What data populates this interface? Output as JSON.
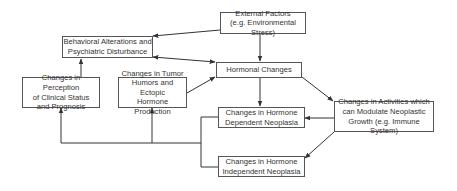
{
  "diagram": {
    "nodes": {
      "external": "External Factors\n(e.g. Environmental Stress)",
      "behavioral": "Behavioral Alterations and\nPsychiatric Disturbance",
      "hormonal": "Hormonal Changes",
      "perception": "Changes in Perception\nof Clinical Status\nand Prognosis",
      "tumor_humors": "Changes in Tumor\nHumors and Ectopic\nHormone Production",
      "dependent": "Changes in Hormone\nDependent Neoplasia",
      "activities": "Changes in Activities which\ncan Modulate Neoplastic\nGrowth (e.g. Immune System)",
      "independent": "Changes in Hormone\nIndependent Neoplasia"
    },
    "edges": [
      {
        "from": "external",
        "to": "behavioral"
      },
      {
        "from": "external",
        "to": "hormonal"
      },
      {
        "from": "behavioral",
        "to": "hormonal",
        "bidirectional": true
      },
      {
        "from": "tumor_humors",
        "to": "hormonal"
      },
      {
        "from": "perception",
        "to": "behavioral"
      },
      {
        "from": "hormonal",
        "to": "dependent"
      },
      {
        "from": "hormonal",
        "to": "activities"
      },
      {
        "from": "activities",
        "to": "dependent"
      },
      {
        "from": "activities",
        "to": "independent"
      },
      {
        "from": "dependent",
        "to": "perception"
      },
      {
        "from": "dependent",
        "to": "tumor_humors"
      },
      {
        "from": "independent",
        "to": "perception"
      },
      {
        "from": "independent",
        "to": "tumor_humors"
      }
    ]
  }
}
